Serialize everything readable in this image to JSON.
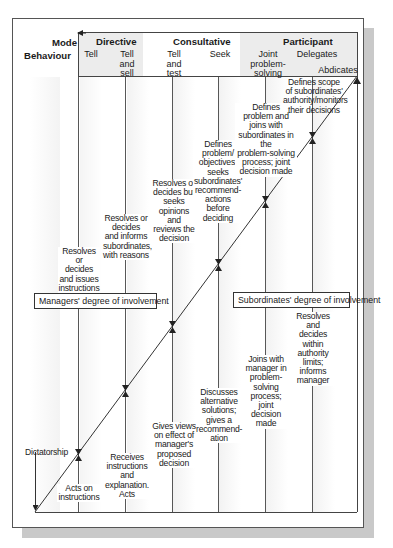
{
  "diagram": {
    "row_labels": {
      "mode": "Mode",
      "behaviour": "Behaviour"
    },
    "modes": [
      {
        "label": "Directive"
      },
      {
        "label": "Consultative"
      },
      {
        "label": "Participant"
      }
    ],
    "behaviours": [
      {
        "label": "Tell"
      },
      {
        "label": "Tell and sell",
        "lines": [
          "Tell",
          "and",
          "sell"
        ]
      },
      {
        "label": "Tell and test",
        "lines": [
          "Tell",
          "and",
          "test"
        ]
      },
      {
        "label": "Seek"
      },
      {
        "label": "Joint problem-solving",
        "lines": [
          "Joint",
          "problem-",
          "solving"
        ]
      },
      {
        "label": "Delegates"
      },
      {
        "label": "Abdicates"
      }
    ],
    "manager_actions": [
      "Resolves or decides and issues instructions only",
      "Resolves or decides and informs subordinates, with reasons",
      "Resolves or decides but seeks opinions and reviews the decision",
      "Defines problem/ objectives, seeks subordinates' recommend-actions before deciding",
      "Defines problem and joins with subordinates in the problem-solving process; joint decision made",
      "Defines scope of subordinates' authority/monitors their decisions"
    ],
    "subordinate_actions": [
      "Acts on instructions",
      "Receives instructions and explanation. Acts",
      "Gives views on effect of manager's proposed decision",
      "Discusses alternative solutions; gives a recommend-ation",
      "Joins with manager in problem-solving process; joint decision made",
      "Resolves and decides within authority limits; informs manager"
    ],
    "managers_involvement_label": "Managers' degree of involvement",
    "subordinates_involvement_label": "Subordinates' degree of involvement",
    "endpoint_label": "Dictatorship",
    "colors": {
      "line": "#333333",
      "header_shade": "#e6e6e6",
      "shadow": "#c9c9c9",
      "column_shade": "#efefef"
    }
  },
  "text": {
    "t0": "Resolves or",
    "t1": "decides",
    "t2": "and issues",
    "t3": "instructions",
    "t4": "only",
    "u0": "Resolves or",
    "u1": "decides",
    "u2": "and informs",
    "u3": "subordinates,",
    "u4": "with reasons",
    "v0": "Resolves or",
    "v1": "decides but",
    "v2": "seeks",
    "v3": "opinions and",
    "v4": "reviews the",
    "v5": "decision",
    "w0": "Defines",
    "w1": "problem/",
    "w2": "objectives,",
    "w3": "seeks",
    "w4": "subordinates'",
    "w5": "recommend-",
    "w6": "actions before",
    "w7": "deciding",
    "x0": "Defines",
    "x1": "problem and",
    "x2": "joins with",
    "x3": "subordinates in the",
    "x4": "problem-solving",
    "x5": "process; joint",
    "x6": "decision made",
    "y0": "Defines scope",
    "y1": "of subordinates'",
    "y2": "authority/monitors",
    "y3": "their decisions",
    "s0": "Acts on",
    "s1": "instructions",
    "r0": "Receives",
    "r1": "instructions",
    "r2": "and",
    "r3": "explanation.",
    "r4": "Acts",
    "g0": "Gives views",
    "g1": "on effect of",
    "g2": "manager's",
    "g3": "proposed",
    "g4": "decision",
    "d0": "Discusses",
    "d1": "alternative",
    "d2": "solutions;",
    "d3": "gives a",
    "d4": "recommend-",
    "d5": "ation",
    "j0": "Joins with",
    "j1": "manager in",
    "j2": "problem-",
    "j3": "solving",
    "j4": "process;",
    "j5": "joint",
    "j6": "decision",
    "j7": "made",
    "k0": "Resolves",
    "k1": "and",
    "k2": "decides",
    "k3": "within",
    "k4": "authority",
    "k5": "limits;",
    "k6": "informs",
    "k7": "manager"
  }
}
